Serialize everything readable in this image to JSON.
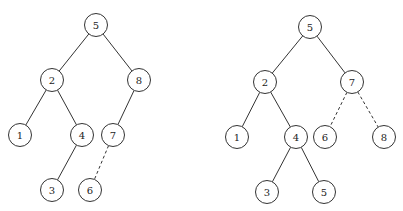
{
  "diagram": {
    "type": "binary-search-tree-comparison",
    "node_radius": 11.5,
    "trees": [
      {
        "name": "left-tree",
        "nodes": [
          {
            "id": "L5",
            "label": "5",
            "x": 96,
            "y": 25
          },
          {
            "id": "L2",
            "label": "2",
            "x": 52,
            "y": 80
          },
          {
            "id": "L8",
            "label": "8",
            "x": 139,
            "y": 80
          },
          {
            "id": "L1",
            "label": "1",
            "x": 20,
            "y": 135
          },
          {
            "id": "L4",
            "label": "4",
            "x": 82,
            "y": 135
          },
          {
            "id": "L7",
            "label": "7",
            "x": 113,
            "y": 135
          },
          {
            "id": "L3",
            "label": "3",
            "x": 52,
            "y": 190
          },
          {
            "id": "L6",
            "label": "6",
            "x": 90,
            "y": 190
          }
        ],
        "edges": [
          {
            "from": "L5",
            "to": "L2",
            "style": "solid"
          },
          {
            "from": "L5",
            "to": "L8",
            "style": "solid"
          },
          {
            "from": "L2",
            "to": "L1",
            "style": "solid"
          },
          {
            "from": "L2",
            "to": "L4",
            "style": "solid"
          },
          {
            "from": "L8",
            "to": "L7",
            "style": "solid"
          },
          {
            "from": "L4",
            "to": "L3",
            "style": "solid"
          },
          {
            "from": "L7",
            "to": "L6",
            "style": "dashed"
          }
        ]
      },
      {
        "name": "right-tree",
        "nodes": [
          {
            "id": "R5",
            "label": "5",
            "x": 310,
            "y": 27
          },
          {
            "id": "R2",
            "label": "2",
            "x": 265,
            "y": 82
          },
          {
            "id": "R7",
            "label": "7",
            "x": 352,
            "y": 82
          },
          {
            "id": "R1",
            "label": "1",
            "x": 237,
            "y": 137
          },
          {
            "id": "R4",
            "label": "4",
            "x": 296,
            "y": 137
          },
          {
            "id": "R6",
            "label": "6",
            "x": 325,
            "y": 137
          },
          {
            "id": "R8",
            "label": "8",
            "x": 384,
            "y": 137
          },
          {
            "id": "R3",
            "label": "3",
            "x": 267,
            "y": 192
          },
          {
            "id": "R5b",
            "label": "5",
            "x": 324,
            "y": 192
          }
        ],
        "edges": [
          {
            "from": "R5",
            "to": "R2",
            "style": "solid"
          },
          {
            "from": "R5",
            "to": "R7",
            "style": "solid"
          },
          {
            "from": "R2",
            "to": "R1",
            "style": "solid"
          },
          {
            "from": "R2",
            "to": "R4",
            "style": "solid"
          },
          {
            "from": "R7",
            "to": "R6",
            "style": "dashed"
          },
          {
            "from": "R7",
            "to": "R8",
            "style": "dashed"
          },
          {
            "from": "R4",
            "to": "R3",
            "style": "solid"
          },
          {
            "from": "R4",
            "to": "R5b",
            "style": "solid"
          }
        ]
      }
    ]
  }
}
